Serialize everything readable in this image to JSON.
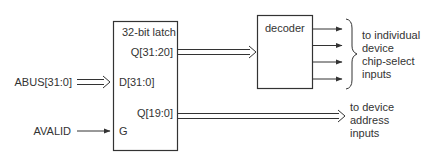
{
  "diagram": {
    "latch": {
      "title": "32-bit latch",
      "ports": {
        "q_high": "Q[31:20]",
        "d": "D[31:0]",
        "q_low": "Q[19:0]",
        "g": "G"
      }
    },
    "inputs": {
      "abus": "ABUS[31:0]",
      "avalid": "AVALID"
    },
    "decoder": {
      "title": "decoder",
      "output_count": 4
    },
    "annotations": {
      "chip_select": [
        "to individual",
        "device",
        "chip-select",
        "inputs"
      ],
      "address": [
        "to device",
        "address",
        "inputs"
      ]
    },
    "colors": {
      "line": "#333333",
      "background": "#ffffff"
    }
  }
}
